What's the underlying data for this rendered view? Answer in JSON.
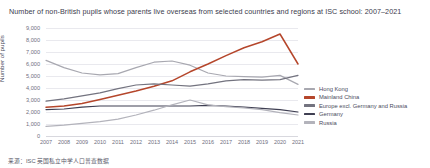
{
  "chart_data": {
    "type": "line",
    "title": "Number of non-British pupils whose parents live overseas from selected countries and regions at ISC school: 2007–2021",
    "xlabel": "",
    "ylabel": "Number of pupils",
    "ylim": [
      0,
      9000
    ],
    "ytick_labels": [
      "9,000",
      "8,000",
      "7,000",
      "6,000",
      "5,000",
      "4,000",
      "3,000",
      "2,000",
      "1,000",
      "0"
    ],
    "ytick_values": [
      9000,
      8000,
      7000,
      6000,
      5000,
      4000,
      3000,
      2000,
      1000,
      0
    ],
    "grid": true,
    "legend_position": "right",
    "x": [
      2007,
      2008,
      2009,
      2010,
      2011,
      2012,
      2013,
      2014,
      2015,
      2016,
      2017,
      2018,
      2019,
      2020,
      2021
    ],
    "categories": [
      "2007",
      "2008",
      "2009",
      "2010",
      "2011",
      "2012",
      "2013",
      "2014",
      "2015",
      "2016",
      "2017",
      "2018",
      "2019",
      "2020",
      "2021"
    ],
    "series": [
      {
        "name": "Hong Kong",
        "color": "#a8a8b0",
        "values": [
          6300,
          5700,
          5250,
          5100,
          5200,
          5700,
          6150,
          6250,
          5900,
          5250,
          5000,
          4950,
          4900,
          5050,
          4300
        ]
      },
      {
        "name": "Mainland China",
        "color": "#b5462b",
        "values": [
          2400,
          2500,
          2700,
          3050,
          3400,
          3750,
          4150,
          4600,
          5350,
          6000,
          6700,
          7350,
          7850,
          8500,
          6000
        ]
      },
      {
        "name": "Europe excl. Germany and Russia",
        "color": "#73737f",
        "values": [
          2900,
          3100,
          3350,
          3600,
          3950,
          4250,
          4350,
          4250,
          4150,
          4350,
          4600,
          4700,
          4650,
          4700,
          5050
        ]
      },
      {
        "name": "Germany",
        "color": "#3f3f52",
        "values": [
          2200,
          2250,
          2400,
          2500,
          2500,
          2500,
          2500,
          2500,
          2500,
          2550,
          2500,
          2400,
          2300,
          2200,
          2000
        ]
      },
      {
        "name": "Russia",
        "color": "#b3b3bb",
        "values": [
          800,
          900,
          1050,
          1200,
          1400,
          1750,
          2150,
          2600,
          3000,
          2600,
          2450,
          2350,
          2200,
          1950,
          1750
        ]
      }
    ]
  },
  "source": {
    "text": "来源：ISC 英国私立中学人口普查数据"
  }
}
